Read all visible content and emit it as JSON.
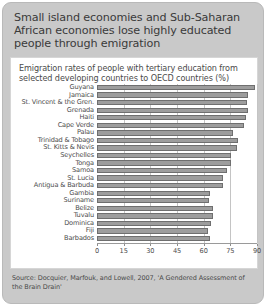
{
  "headline": "Small island economies and Sub-Saharan African economies lose highly educated people through emigration",
  "source": "Source: Docquier, Marfouk, and Lowell, 2007, 'A Gendered Assessment of the Brain Drain'",
  "colors": {
    "header_background": "#c9c9c9",
    "panel_background": "#ffffff",
    "bar_fill": "#9d9d9d",
    "bar_border": "#6f6f6f",
    "gridline": "#c4c4c4",
    "text": "#4a4a4a"
  },
  "chart_data": {
    "type": "bar",
    "orientation": "horizontal",
    "title": "Emigration rates of people with tertiary education from selected developing countries to OECD countries (%)",
    "xlabel": "",
    "ylabel": "",
    "xlim": [
      0,
      90
    ],
    "ticks": [
      0,
      15,
      30,
      45,
      60,
      75,
      90
    ],
    "grid": true,
    "legend": "none",
    "categories": [
      "Guyana",
      "Jamaica",
      "St. Vincent & the Gren.",
      "Grenada",
      "Haiti",
      "Cape Verde",
      "Palau",
      "Trinidad & Tobago",
      "St. Kitts & Nevis",
      "Seychelles",
      "Tonga",
      "Samoa",
      "St. Lucia",
      "Antigua & Barbuda",
      "Gambia",
      "Suriname",
      "Belize",
      "Tuvalu",
      "Dominica",
      "Fiji",
      "Barbados"
    ],
    "values": [
      89.0,
      85.1,
      84.5,
      85.1,
      83.6,
      82.5,
      76.4,
      79.3,
      78.5,
      75.6,
      75.2,
      73.4,
      71.1,
      71.0,
      63.3,
      63.1,
      65.5,
      65.0,
      64.2,
      62.2,
      63.5
    ]
  }
}
